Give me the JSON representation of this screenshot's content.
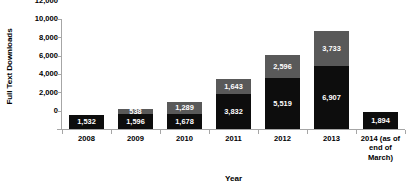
{
  "chart_data": {
    "type": "bar",
    "subtype": "stacked-bar",
    "title": "",
    "xlabel": "Year",
    "ylabel": "Full Text Downloads",
    "ylim": [
      0,
      12000
    ],
    "ytick_values": [
      0,
      2000,
      4000,
      6000,
      8000,
      10000,
      12000
    ],
    "ytick_labels": [
      "0",
      "2,000",
      "4,000",
      "6,000",
      "8,000",
      "10,000",
      "12,000"
    ],
    "grid": false,
    "legend": "none",
    "categories": [
      "2008",
      "2009",
      "2010",
      "2011",
      "2012",
      "2013",
      "2014 (as of end of March)"
    ],
    "category_display_lines": [
      [
        "2008"
      ],
      [
        "2009"
      ],
      [
        "2010"
      ],
      [
        "2011"
      ],
      [
        "2012"
      ],
      [
        "2013"
      ],
      [
        "2014 (as of",
        "end of",
        "March)"
      ]
    ],
    "series": [
      {
        "name": "lower-segment",
        "color": "#0d0d0d",
        "values": [
          1532,
          1596,
          1678,
          3832,
          5519,
          6907,
          1894
        ],
        "labels": [
          "1,532",
          "1,596",
          "1,678",
          "3,832",
          "5,519",
          "6,907",
          "1,894"
        ]
      },
      {
        "name": "upper-segment",
        "color": "#595959",
        "values": [
          0,
          538,
          1289,
          1643,
          2596,
          3733,
          0
        ],
        "labels": [
          "",
          "538",
          "1,289",
          "1,643",
          "2,596",
          "3,733",
          ""
        ]
      }
    ],
    "totals": [
      1532,
      2134,
      2967,
      5475,
      8115,
      10640,
      1894
    ]
  },
  "colors": {
    "lower_segment": "#0d0d0d",
    "upper_segment": "#595959",
    "axis_line": "#a6a6a6",
    "label_text": "#ffffff",
    "axis_text": "#000000",
    "background": "#ffffff"
  }
}
